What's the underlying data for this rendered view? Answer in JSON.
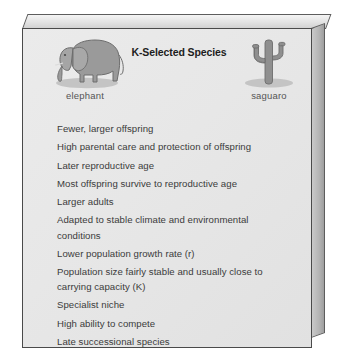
{
  "panel": {
    "title": "K-Selected Species",
    "figures": [
      {
        "icon": "elephant-icon",
        "label": "elephant"
      },
      {
        "icon": "saguaro-cactus-icon",
        "label": "saguaro"
      }
    ],
    "traits": [
      "Fewer, larger offspring",
      "High parental care and protection of offspring",
      "Later reproductive age",
      "Most offspring survive to reproductive age",
      "Larger adults",
      "Adapted to stable climate and environmental conditions",
      "Lower population growth rate (r)",
      "Population size fairly stable and usually close to carrying capacity (K)",
      "Specialist niche",
      "High ability to compete",
      "Late successional species"
    ]
  },
  "colors": {
    "panel_background": "#e7e7e7",
    "panel_border": "#4a4a4a",
    "title_text": "#1d1d1d",
    "body_text": "#3b3b3b",
    "label_text": "#555555",
    "figure_fill": "#9a9a9a",
    "figure_outline": "#6d6d6d",
    "shadow": "#bdbdbd"
  }
}
